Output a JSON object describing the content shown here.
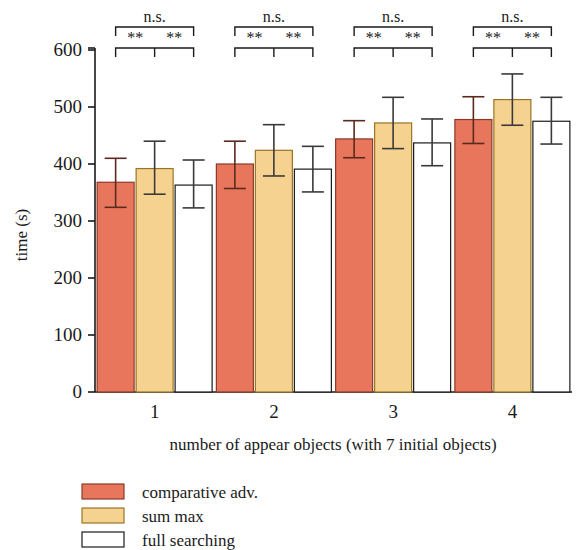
{
  "chart_data": {
    "type": "bar",
    "title": "",
    "xlabel": "number of appear objects (with 7 initial objects)",
    "ylabel": "time (s)",
    "categories": [
      "1",
      "2",
      "3",
      "4"
    ],
    "ylim": [
      0,
      600
    ],
    "yticks": [
      0,
      100,
      200,
      300,
      400,
      500,
      600
    ],
    "ytick_labels": [
      "0",
      "100",
      "200",
      "300",
      "400",
      "500",
      "600"
    ],
    "grid": false,
    "legend_position": "below-left",
    "series": [
      {
        "name": "comparative adv.",
        "color": "#e8765c",
        "values": [
          368,
          400,
          444,
          478
        ],
        "err_low": [
          44,
          43,
          33,
          42
        ],
        "err_high": [
          42,
          40,
          32,
          40
        ]
      },
      {
        "name": "sum max",
        "color": "#f6d291",
        "values": [
          392,
          424,
          472,
          513
        ],
        "err_low": [
          45,
          45,
          45,
          45
        ],
        "err_high": [
          48,
          45,
          45,
          45
        ]
      },
      {
        "name": "full searching",
        "color": "#ffffff",
        "values": [
          363,
          391,
          437,
          475
        ],
        "err_low": [
          40,
          40,
          40,
          40
        ],
        "err_high": [
          44,
          40,
          42,
          42
        ]
      }
    ],
    "annotations": [
      {
        "group": "1",
        "label": "n.s.",
        "spans": "comparative adv. vs full searching"
      },
      {
        "group": "1",
        "label": "**",
        "spans": "comparative adv. vs sum max"
      },
      {
        "group": "1",
        "label": "**",
        "spans": "sum max vs full searching"
      },
      {
        "group": "2",
        "label": "n.s.",
        "spans": "comparative adv. vs full searching"
      },
      {
        "group": "2",
        "label": "**",
        "spans": "comparative adv. vs sum max"
      },
      {
        "group": "2",
        "label": "**",
        "spans": "sum max vs full searching"
      },
      {
        "group": "3",
        "label": "n.s.",
        "spans": "comparative adv. vs full searching"
      },
      {
        "group": "3",
        "label": "**",
        "spans": "comparative adv. vs sum max"
      },
      {
        "group": "3",
        "label": "**",
        "spans": "sum max vs full searching"
      },
      {
        "group": "4",
        "label": "n.s.",
        "spans": "comparative adv. vs full searching"
      },
      {
        "group": "4",
        "label": "**",
        "spans": "comparative adv. vs sum max"
      },
      {
        "group": "4",
        "label": "**",
        "spans": "sum max vs full searching"
      }
    ]
  },
  "axis": {
    "y_title": "time (s)",
    "x_title": "number of appear objects (with 7 initial objects)",
    "y_ticks": [
      "600",
      "500",
      "400",
      "300",
      "200",
      "100",
      "0"
    ],
    "x_ticks": [
      "1",
      "2",
      "3",
      "4"
    ]
  },
  "significance": {
    "ns": "n.s.",
    "stars": "**",
    "groups": [
      {
        "ns": "n.s.",
        "left": "**",
        "right": "**"
      },
      {
        "ns": "n.s.",
        "left": "**",
        "right": "**"
      },
      {
        "ns": "n.s.",
        "left": "**",
        "right": "**"
      },
      {
        "ns": "n.s.",
        "left": "**",
        "right": "**"
      }
    ]
  },
  "legend": {
    "items": [
      {
        "label": "comparative adv.",
        "color": "#e8765c"
      },
      {
        "label": "sum max",
        "color": "#f6d291"
      },
      {
        "label": "full searching",
        "color": "#ffffff"
      }
    ]
  },
  "colors": {
    "series_1": "#e8765c",
    "series_2": "#f6d291",
    "series_3": "#ffffff",
    "axis": "#1a1a1a",
    "background": "#ffffff"
  }
}
